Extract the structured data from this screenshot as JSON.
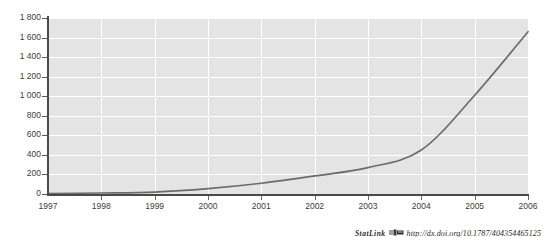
{
  "figure": {
    "title_clipped": "(continued)"
  },
  "chart_data": {
    "type": "line",
    "title": "",
    "subtitle": "",
    "xlabel": "",
    "ylabel": "",
    "x": [
      1997,
      1998,
      1999,
      2000,
      2001,
      2002,
      2003,
      2004,
      2005,
      2006
    ],
    "categories": [
      "1997",
      "1998",
      "1999",
      "2000",
      "2001",
      "2002",
      "2003",
      "2004",
      "2005",
      "2006"
    ],
    "series": [
      {
        "name": "Series 1",
        "values": [
          5,
          10,
          20,
          55,
          110,
          185,
          270,
          450,
          1010,
          1660
        ]
      }
    ],
    "values": [
      5,
      10,
      20,
      55,
      110,
      185,
      270,
      450,
      1010,
      1660
    ],
    "ylim": [
      0,
      1800
    ],
    "xlim": [
      1997,
      2006
    ],
    "yticks": [
      0,
      200,
      400,
      600,
      800,
      1000,
      1200,
      1400,
      1600,
      1800
    ],
    "ytick_labels": [
      "0",
      "200",
      "400",
      "600",
      "800",
      "1 000",
      "1 200",
      "1 400",
      "1 600",
      "1 800"
    ],
    "xticks": [
      1997,
      1998,
      1999,
      2000,
      2001,
      2002,
      2003,
      2004,
      2005,
      2006
    ],
    "xtick_labels": [
      "1997",
      "1998",
      "1999",
      "2000",
      "2001",
      "2002",
      "2003",
      "2004",
      "2005",
      "2006"
    ],
    "grid": "horizontal-and-vertical",
    "grid_color": "#ffffff",
    "plot_background": "#e4e4e4",
    "line_color": "#6b6b6b",
    "legend": "none",
    "legend_position": "none",
    "annotations": []
  },
  "footer": {
    "statlink_label": "StatLink",
    "statlink_icon": "statlink-glyph-icon",
    "url": "http://dx.doi.org/10.1787/404354465125"
  }
}
